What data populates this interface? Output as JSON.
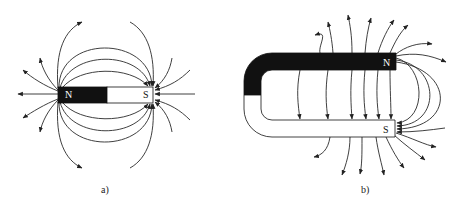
{
  "figure_a": {
    "caption": "a)",
    "type": "bar magnet",
    "north_label": "N",
    "south_label": "S",
    "north_color": "#111111",
    "south_color": "#ffffff"
  },
  "figure_b": {
    "caption": "b)",
    "type": "horseshoe magnet",
    "north_label": "N",
    "south_label": "S",
    "north_color": "#111111",
    "south_color": "#ffffff"
  }
}
